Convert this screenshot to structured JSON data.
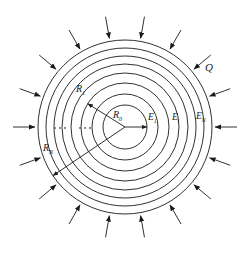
{
  "figure": {
    "background_color": "#ffffff",
    "stroke_color": "#1a1a1a",
    "center": {
      "x": 125,
      "y": 127
    }
  },
  "labels": {
    "charge": {
      "text": "Q",
      "sub": "",
      "x": 205,
      "y": 68
    },
    "r_zero": {
      "text": "R",
      "sub": "0",
      "x": 113,
      "y": 116
    },
    "r_one": {
      "text": "R",
      "sub": "1",
      "x": 76,
      "y": 89
    },
    "r_n": {
      "text": "R",
      "sub": "N",
      "x": 43,
      "y": 148
    },
    "e_one": {
      "text": "E",
      "sub": "1",
      "x": 148,
      "y": 118
    },
    "e_i": {
      "text": "E",
      "sub": "i",
      "x": 172,
      "y": 118
    },
    "e_n": {
      "text": "E",
      "sub": "N",
      "x": 196,
      "y": 117
    }
  },
  "chart_data": {
    "type": "diagram",
    "circles": {
      "count": 8,
      "radii": [
        22,
        33,
        44,
        54,
        63,
        71,
        79,
        87
      ],
      "note": "concentric circles centred at (125,127), innermost R0 to outermost RN"
    },
    "field_arrows": {
      "count": 18,
      "direction": "inward-radial",
      "tail_radius": 112,
      "head_radius": 90,
      "angles_deg": [
        0,
        20,
        40,
        60,
        80,
        100,
        120,
        140,
        160,
        180,
        200,
        220,
        240,
        260,
        280,
        300,
        320,
        340
      ]
    },
    "radius_lines": [
      {
        "name": "R0",
        "angle_deg": 0,
        "length": 22,
        "arrow": true,
        "label": "R0"
      },
      {
        "name": "R1",
        "angle_deg": 148,
        "length": 44,
        "arrow": true,
        "label": "R1"
      },
      {
        "name": "RN",
        "angle_deg": 214,
        "length": 87,
        "arrow": true,
        "label": "RN"
      }
    ],
    "ellipses": [
      {
        "x": 55,
        "y": 128,
        "dots": 3
      },
      {
        "x": 80,
        "y": 128,
        "dots": 3
      }
    ],
    "field_labels": [
      "E1",
      "Ei",
      "EN"
    ],
    "charge_label": "Q"
  }
}
